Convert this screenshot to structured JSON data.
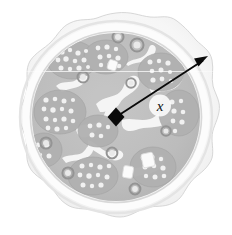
{
  "figure": {
    "kind": "geometry-illustration",
    "background_color": "#ffffff",
    "canvas": {
      "width": 232,
      "height": 235
    }
  },
  "annotation": {
    "label": "x",
    "label_style": "italic",
    "label_color": "#101010",
    "label_position": {
      "x": 160,
      "y": 110
    },
    "measures": "radius",
    "arrow": {
      "from": {
        "x": 116,
        "y": 117
      },
      "to": {
        "x": 207,
        "y": 58
      },
      "color": "#0a0a0a",
      "stroke_width": 1.8,
      "start_marker": "diamond",
      "end_marker": "arrowhead"
    }
  },
  "pizza": {
    "center": {
      "x": 116,
      "y": 117
    },
    "outer_radius": 104,
    "crust_outline_color": "#cfcfcf",
    "crust_fill_color": "#f2f2f2",
    "crust_highlight_color": "#fbfbfb",
    "inner_edge_color": "#fdfdfd",
    "cheese_color": "#bdbdbd",
    "cheese_shadow_color": "#ababab",
    "sauce_gap_color": "#fafafa",
    "topping_light_color": "#eeeeee",
    "topping_ring_color": "#9c9c9c",
    "topping_dot_color": "#f4f4f4",
    "toppings": [
      {
        "kind": "olive-ring",
        "x": 137,
        "y": 45,
        "r": 7
      },
      {
        "kind": "olive-ring",
        "x": 118,
        "y": 38,
        "r": 6
      },
      {
        "kind": "olive-ring",
        "x": 83,
        "y": 77,
        "r": 6
      },
      {
        "kind": "olive-ring",
        "x": 131,
        "y": 83,
        "r": 5
      },
      {
        "kind": "olive-ring",
        "x": 46,
        "y": 143,
        "r": 6
      },
      {
        "kind": "olive-ring",
        "x": 68,
        "y": 173,
        "r": 6
      },
      {
        "kind": "olive-ring",
        "x": 112,
        "y": 153,
        "r": 6
      },
      {
        "kind": "olive-ring",
        "x": 135,
        "y": 189,
        "r": 6
      },
      {
        "kind": "olive-ring",
        "x": 166,
        "y": 131,
        "r": 5
      },
      {
        "kind": "cheese-chunk",
        "x": 148,
        "y": 160,
        "w": 11,
        "h": 13
      },
      {
        "kind": "cheese-chunk",
        "x": 128,
        "y": 172,
        "w": 9,
        "h": 11
      },
      {
        "kind": "pepperoni-cluster",
        "x": 72,
        "y": 60
      },
      {
        "kind": "pepperoni-cluster",
        "x": 104,
        "y": 58
      },
      {
        "kind": "pepperoni-cluster",
        "x": 60,
        "y": 110
      },
      {
        "kind": "pepperoni-cluster",
        "x": 160,
        "y": 72
      },
      {
        "kind": "pepperoni-cluster",
        "x": 92,
        "y": 175
      },
      {
        "kind": "pepperoni-cluster",
        "x": 152,
        "y": 166
      },
      {
        "kind": "pepperoni-cluster",
        "x": 178,
        "y": 112
      }
    ]
  }
}
